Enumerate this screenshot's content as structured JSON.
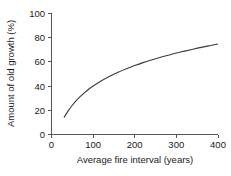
{
  "chart_data": {
    "type": "line",
    "title": "",
    "xlabel": "Average fire interval (years)",
    "ylabel": "Amount of old growth (%)",
    "xlim": [
      0,
      400
    ],
    "ylim": [
      0,
      100
    ],
    "xticks": [
      0,
      100,
      200,
      300,
      400
    ],
    "yticks": [
      0,
      20,
      40,
      60,
      80,
      100
    ],
    "xtick_labels": [
      "0",
      "100",
      "200",
      "300",
      "400"
    ],
    "ytick_labels": [
      "0",
      "20",
      "40",
      "60",
      "80",
      "100"
    ],
    "grid": false,
    "legend": null,
    "series": [
      {
        "name": "Old growth vs fire interval",
        "color": "#3b3b3b",
        "x": [
          30,
          40,
          50,
          60,
          70,
          80,
          90,
          100,
          120,
          140,
          160,
          180,
          200,
          220,
          240,
          260,
          280,
          300,
          320,
          340,
          360,
          380,
          400
        ],
        "y": [
          14,
          19.5,
          24.2,
          28.2,
          31.7,
          34.8,
          37.6,
          40.1,
          44.5,
          48.2,
          51.5,
          54.4,
          57.0,
          59.4,
          61.6,
          63.6,
          65.5,
          67.3,
          68.9,
          70.5,
          72.0,
          73.4,
          74.8
        ]
      }
    ]
  },
  "axes": {
    "x_title": "Average fire interval (years)",
    "y_title": "Amount of old growth (%)"
  }
}
